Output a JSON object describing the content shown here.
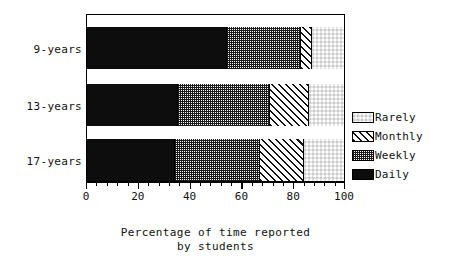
{
  "chart_data": {
    "type": "bar",
    "orientation": "horizontal",
    "stacked": true,
    "normalized_percent": true,
    "title": "",
    "xlabel_lines": [
      "Percentage of time reported",
      "by students"
    ],
    "ylabel": "",
    "xlim": [
      0,
      100
    ],
    "grid": false,
    "legend_position": "right",
    "categories": [
      "9-years",
      "13-years",
      "17-years"
    ],
    "xticks": [
      0,
      20,
      40,
      60,
      80,
      100
    ],
    "xticklabels": [
      "0",
      "20",
      "40",
      "60",
      "80",
      "100"
    ],
    "minor_ticks_per_interval": 4,
    "series": [
      {
        "name": "Daily",
        "pattern": "solid-black",
        "values": [
          54,
          35,
          34
        ]
      },
      {
        "name": "Weekly",
        "pattern": "fine-stipple",
        "values": [
          29,
          36,
          33
        ]
      },
      {
        "name": "Monthly",
        "pattern": "diagonal-hatch",
        "values": [
          4,
          15,
          17
        ]
      },
      {
        "name": "Rarely",
        "pattern": "coarse-checker",
        "values": [
          13,
          14,
          16
        ]
      }
    ],
    "legend_order_top_to_bottom": [
      "Rarely",
      "Monthly",
      "Weekly",
      "Daily"
    ]
  },
  "colors": {
    "ink": "#111111",
    "background": "#ffffff",
    "bar_daily": "#0d0d0d",
    "pattern_ink": "#1a1a1a"
  },
  "axis": {
    "tick_0": "0",
    "tick_20": "20",
    "tick_40": "40",
    "tick_60": "60",
    "tick_80": "80",
    "tick_100": "100"
  },
  "categories": {
    "c0": "9-years",
    "c1": "13-years",
    "c2": "17-years"
  },
  "legend": {
    "rarely": "Rarely",
    "monthly": "Monthly",
    "weekly": "Weekly",
    "daily": "Daily"
  },
  "xtitle": {
    "line1": "Percentage of time reported",
    "line2": "by students"
  }
}
